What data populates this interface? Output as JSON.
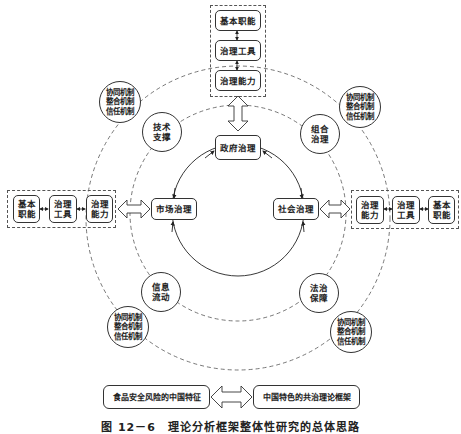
{
  "diagram": {
    "top_group": {
      "items": [
        "基本职能",
        "治理工具",
        "治理能力"
      ]
    },
    "left_group": {
      "items": [
        "基本\n职能",
        "治理\n工具",
        "治理\n能力"
      ]
    },
    "right_group": {
      "items": [
        "治理\n能力",
        "治理\n工具",
        "基本\n职能"
      ]
    },
    "core": {
      "government": "政府治理",
      "market": "市场治理",
      "society": "社会治理"
    },
    "middle_ring": {
      "tech_support": "技术\n支撑",
      "combined_governance": "组合\n治理",
      "info_flow": "信息\n流动",
      "rule_of_law": "法治\n保障"
    },
    "outer_ring": {
      "mechanisms_top_left": "协同机制\n整合机制\n信任机制",
      "mechanisms_top_right": "协同机制\n整合机制\n信任机制",
      "mechanisms_bottom_left": "协同机制\n整合机制\n信任机制",
      "mechanisms_bottom_right": "协同机制\n整合机制\n信任机制"
    },
    "bottom": {
      "left_box": "食品安全风险的中国特征",
      "right_box": "中国特色的共治理论框架"
    },
    "caption": "图 12－6　理论分析框架整体性研究的总体思路"
  }
}
